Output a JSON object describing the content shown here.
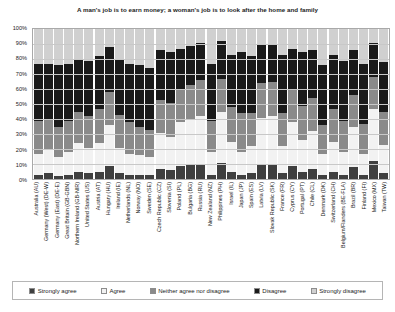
{
  "chart_data": {
    "type": "bar",
    "subtype": "100% stacked bar",
    "title": "A man's job is to earn money; a woman's job is to look after the home and family",
    "xlabel": "",
    "ylabel": "",
    "ylim": [
      0,
      100
    ],
    "ytick_labels": [
      "0%",
      "10%",
      "20%",
      "30%",
      "40%",
      "50%",
      "60%",
      "70%",
      "80%",
      "90%",
      "100%"
    ],
    "ytick_values": [
      0,
      10,
      20,
      30,
      40,
      50,
      60,
      70,
      80,
      90,
      100
    ],
    "grid": true,
    "legend_position": "bottom",
    "stack_order_bottom_to_top": [
      "Strongly agree",
      "Agree",
      "Neither agree nor disagree",
      "Disagree",
      "Strongly disagree"
    ],
    "colors": {
      "Strongly agree": "#3f3f3f",
      "Agree": "#f2f2f2",
      "Neither agree nor disagree": "#8a8a8a",
      "Disagree": "#1a1a1a",
      "Strongly disagree": "#d0d0d0"
    },
    "categories": [
      "Australia (AU)",
      "Germany (West) (DE-W)",
      "Germany (East) (DE-E)",
      "Great Britain (GB-GBN)",
      "Northern Ireland (GB-NIR)",
      "United States (US)",
      "Austria (AT)",
      "Hungary (HU)",
      "Ireland (IE)",
      "Netherlands (NL)",
      "Norway (NO)",
      "Sweden (SE)",
      "Czech Republic (CZ)",
      "Slovenia (SI)",
      "Poland (PL)",
      "Bulgaria (BG)",
      "Russia (RU)",
      "New Zealand (NZ)",
      "Philippines (PH)",
      "Israel (IL)",
      "Japan (JP)",
      "Spain (ES)",
      "Latvia (LV)",
      "Slovak Republic (SK)",
      "France (FR)",
      "Cyprus (CY)",
      "Portugal (PT)",
      "Chile (CL)",
      "Denmark (DK)",
      "Switzerland (CH)",
      "Belgium/Flanders (BE-FLA)",
      "Brazil (BR)",
      "Finland (FI)",
      "Mexico (MX)",
      "Taiwan (TW)"
    ],
    "series": [
      {
        "name": "Strongly agree",
        "values": [
          3,
          4,
          2,
          3,
          5,
          4,
          5,
          9,
          4,
          3,
          3,
          3,
          7,
          6,
          9,
          10,
          10,
          3,
          11,
          5,
          3,
          4,
          10,
          10,
          4,
          9,
          5,
          7,
          3,
          5,
          3,
          8,
          3,
          12,
          4
        ]
      },
      {
        "name": "Agree",
        "values": [
          14,
          16,
          13,
          15,
          19,
          17,
          19,
          27,
          17,
          14,
          13,
          12,
          24,
          22,
          29,
          30,
          32,
          15,
          34,
          20,
          15,
          18,
          31,
          32,
          18,
          29,
          21,
          25,
          14,
          20,
          15,
          27,
          14,
          35,
          19
        ]
      },
      {
        "name": "Neither agree nor disagree",
        "values": [
          22,
          20,
          20,
          21,
          21,
          21,
          23,
          22,
          22,
          21,
          19,
          18,
          22,
          23,
          22,
          23,
          24,
          21,
          22,
          23,
          26,
          22,
          23,
          23,
          22,
          22,
          23,
          22,
          19,
          22,
          21,
          21,
          20,
          21,
          22
        ]
      },
      {
        "name": "Disagree",
        "values": [
          38,
          37,
          41,
          38,
          35,
          37,
          35,
          30,
          37,
          39,
          41,
          41,
          33,
          34,
          27,
          26,
          25,
          38,
          25,
          35,
          41,
          38,
          26,
          25,
          39,
          27,
          36,
          32,
          40,
          36,
          40,
          30,
          40,
          23,
          33
        ]
      },
      {
        "name": "Strongly disagree",
        "values": [
          23,
          23,
          24,
          23,
          20,
          21,
          18,
          12,
          20,
          23,
          24,
          26,
          14,
          15,
          13,
          11,
          9,
          23,
          8,
          17,
          15,
          18,
          10,
          10,
          17,
          13,
          15,
          14,
          24,
          17,
          21,
          14,
          23,
          9,
          22
        ]
      }
    ]
  },
  "legend": {
    "items": [
      {
        "label": "Strongly agree",
        "color": "#3f3f3f"
      },
      {
        "label": "Agree",
        "color": "#f2f2f2"
      },
      {
        "label": "Neither agree nor disagree",
        "color": "#8a8a8a"
      },
      {
        "label": "Disagree",
        "color": "#1a1a1a"
      },
      {
        "label": "Strongly disagree",
        "color": "#d0d0d0"
      }
    ]
  }
}
